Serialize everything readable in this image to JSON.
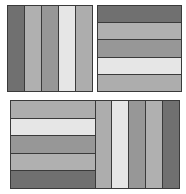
{
  "colors": {
    "dark": "#707070",
    "medium": "#a8a8a8",
    "mid_dark": "#979797",
    "light": "#e4e4e4",
    "border": "#3a3a3a"
  },
  "panels": [
    {
      "id": "top-left-square",
      "orientation": "vertical",
      "stripes": [
        "#707070",
        "#b0b0b0",
        "#979797",
        "#e6e6e6",
        "#adadad"
      ]
    },
    {
      "id": "top-right-square",
      "orientation": "horizontal",
      "stripes": [
        "#707070",
        "#b0b0b0",
        "#979797",
        "#e6e6e6",
        "#adadad"
      ]
    },
    {
      "id": "bottom-rectangle",
      "left_half": {
        "orientation": "horizontal",
        "stripes": [
          "#adadad",
          "#e6e6e6",
          "#979797",
          "#b0b0b0",
          "#707070"
        ]
      },
      "right_half": {
        "orientation": "vertical",
        "stripes": [
          "#adadad",
          "#e6e6e6",
          "#979797",
          "#b0b0b0",
          "#707070"
        ]
      }
    }
  ]
}
